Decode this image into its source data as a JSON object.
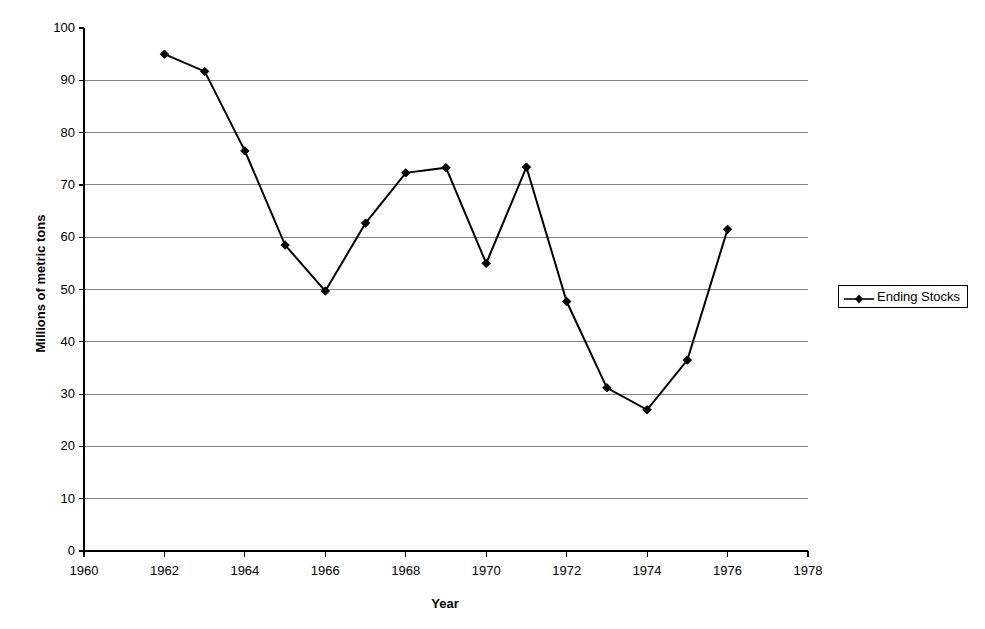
{
  "chart_data": {
    "type": "line",
    "title": "",
    "xlabel": "Year",
    "ylabel": "Millions of metric tons",
    "xlim": [
      1960,
      1978
    ],
    "ylim": [
      0,
      100
    ],
    "xticks": [
      1960,
      1962,
      1964,
      1966,
      1968,
      1970,
      1972,
      1974,
      1976,
      1978
    ],
    "yticks": [
      0,
      10,
      20,
      30,
      40,
      50,
      60,
      70,
      80,
      90,
      100
    ],
    "grid": "horizontal",
    "legend_position": "right-outside",
    "marker": "diamond",
    "line_color": "#000000",
    "marker_color": "#000000",
    "grid_color": "#808080",
    "axis_color": "#000000",
    "x": [
      1962,
      1963,
      1964,
      1965,
      1966,
      1967,
      1968,
      1969,
      1970,
      1971,
      1972,
      1973,
      1974,
      1975,
      1976
    ],
    "series": [
      {
        "name": "Ending Stocks",
        "values": [
          95.0,
          91.7,
          76.5,
          58.5,
          49.7,
          62.7,
          72.3,
          73.3,
          55.0,
          73.4,
          47.7,
          31.2,
          27.0,
          36.5,
          61.5
        ]
      }
    ]
  },
  "axes": {
    "y_title": "Millions of metric tons",
    "x_title": "Year",
    "y_tick_labels": [
      "100",
      "90",
      "80",
      "70",
      "60",
      "50",
      "40",
      "30",
      "20",
      "10",
      "0"
    ],
    "x_tick_labels": [
      "1960",
      "1962",
      "1964",
      "1966",
      "1968",
      "1970",
      "1972",
      "1974",
      "1976",
      "1978"
    ]
  },
  "legend": {
    "entries": [
      {
        "label": "Ending Stocks",
        "marker": "diamond-marker-icon"
      }
    ]
  }
}
